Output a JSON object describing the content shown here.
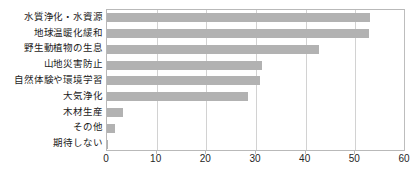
{
  "chart_data": {
    "type": "bar",
    "orientation": "horizontal",
    "title": "",
    "xlabel": "",
    "ylabel": "",
    "xlim": [
      0,
      60
    ],
    "xticks": [
      0,
      10,
      20,
      30,
      40,
      50,
      60
    ],
    "grid": true,
    "grid_axis": "x",
    "legend": false,
    "bar_color": "#b2b2b2",
    "axis_color": "#b9b9b9",
    "grid_color": "#d2d2d2",
    "categories": [
      "水質浄化・水資源",
      "地球温暖化緩和",
      "野生動植物の生息",
      "山地災害防止",
      "自然体験や環境学習",
      "大気浄化",
      "木材生産",
      "その他",
      "期待しない"
    ],
    "values": [
      53.0,
      52.7,
      42.6,
      31.2,
      30.8,
      28.3,
      3.2,
      1.7,
      0.3
    ]
  }
}
